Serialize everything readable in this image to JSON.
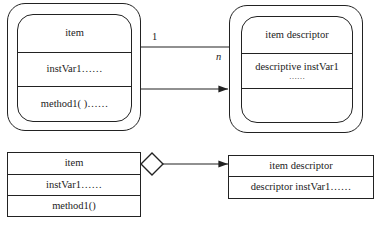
{
  "top_diagram": {
    "left_class": {
      "name": "item",
      "attributes": "instVar1……",
      "methods": "method1( )……"
    },
    "right_class": {
      "name": "item descriptor",
      "attributes_line1": "descriptive instVar1",
      "attributes_line2": "……",
      "methods": ""
    },
    "connection": {
      "multiplicity_left": "1",
      "multiplicity_right": "n",
      "arrow_direction": "left-to-right"
    }
  },
  "bottom_diagram": {
    "left_class": {
      "name": "item",
      "attributes": "instVar1……",
      "methods": "method1()"
    },
    "right_class": {
      "name": "item descriptor",
      "attributes": "descriptor instVar1……"
    },
    "connection": {
      "type": "aggregation",
      "end_symbol": "hollow-diamond",
      "arrow_direction": "left-to-right"
    }
  },
  "colors": {
    "stroke": "#222222",
    "background": "#ffffff"
  }
}
